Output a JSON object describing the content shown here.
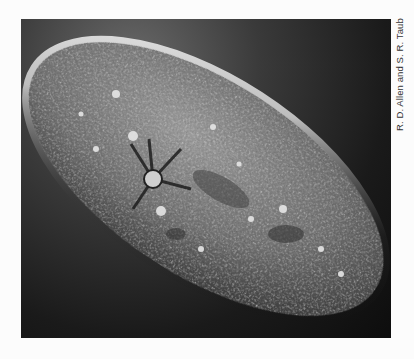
{
  "image": {
    "subject": "Paramecium micrograph",
    "alt": "Grayscale light micrograph of an elongated, slipper-shaped ciliate cell with a textured granular surface, contractile vacuole with radiating canals, on a dark background"
  },
  "credit": "R. D. Allen and S. R. Taub",
  "colors": {
    "page_background": "#fcfcfc",
    "photo_background": "#1a1a1a",
    "cell_body": "#8a8a8a",
    "cell_halo": "#e8e8e8"
  }
}
